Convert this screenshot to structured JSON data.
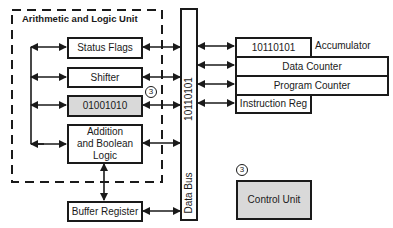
{
  "alu": {
    "title": "Arithmetic and Logic Unit",
    "status_flags": "Status Flags",
    "shifter": "Shifter",
    "register_value": "01001010",
    "register_marker": "3",
    "logic_line1": "Addition",
    "logic_line2": "and Boolean",
    "logic_line3": "Logic"
  },
  "buffer_register": "Buffer Register",
  "data_bus": {
    "label": "Data Bus",
    "value": "10110101"
  },
  "registers": {
    "accumulator_value": "10110101",
    "accumulator_label": "Accumulator",
    "data_counter": "Data Counter",
    "program_counter": "Program Counter",
    "instruction_reg": "Instruction Reg"
  },
  "control_unit": {
    "label": "Control Unit",
    "marker": "3"
  },
  "colors": {
    "line": "#1a1a1a",
    "highlight_fill": "#d9d9d9"
  }
}
